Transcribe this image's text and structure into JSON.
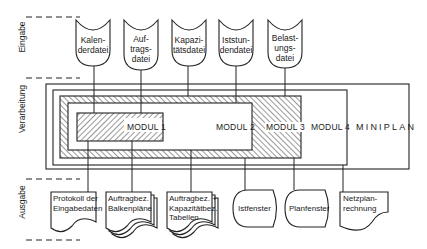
{
  "sections": {
    "input": "Eingabe",
    "processing": "Verarbeitung",
    "output": "Ausgabe"
  },
  "inputs": [
    {
      "line1": "Kalen-",
      "line2": "derdatei",
      "line3": ""
    },
    {
      "line1": "Auf-",
      "line2": "trags-",
      "line3": "datei"
    },
    {
      "line1": "Kapazi-",
      "line2": "tätsdatei",
      "line3": ""
    },
    {
      "line1": "Iststun-",
      "line2": "dendatei",
      "line3": ""
    },
    {
      "line1": "Belast-",
      "line2": "ungs-",
      "line3": "datei"
    }
  ],
  "modules": {
    "m1": "MODUL 1",
    "m2": "MODUL 2",
    "m3": "MODUL 3",
    "m4": "MODUL 4",
    "system": "MINIPLAN"
  },
  "outputs": [
    {
      "type": "document",
      "line1": "Protokoll der",
      "line2": "Eingabedaten",
      "line3": ""
    },
    {
      "type": "multi-document",
      "line1": "Auftragbez.",
      "line2": "Balkenpläne",
      "line3": ""
    },
    {
      "type": "multi-document",
      "line1": "Auftragbez. +",
      "line2": "Kapazitätbez.",
      "line3": "Tabellen"
    },
    {
      "type": "display",
      "line1": "Istfenster",
      "line2": "",
      "line3": ""
    },
    {
      "type": "display",
      "line1": "Planfenster",
      "line2": "",
      "line3": ""
    },
    {
      "type": "document",
      "line1": "Netzplan-",
      "line2": "rechnung",
      "line3": ""
    }
  ]
}
